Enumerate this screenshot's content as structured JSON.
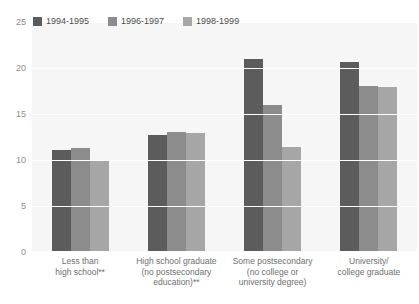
{
  "top_cut_text": "",
  "chart_data": {
    "type": "bar",
    "title": "",
    "xlabel": "",
    "ylabel": "",
    "ylim": [
      0,
      25
    ],
    "yticks": [
      0,
      5,
      10,
      15,
      20,
      25
    ],
    "grid": true,
    "legend_position": "top-left",
    "categories": [
      "Less than\nhigh school**",
      "High school graduate\n(no postsecondary\neducation)**",
      "Some postsecondary\n(no college or\nuniversity degree)",
      "University/\ncollege graduate"
    ],
    "series": [
      {
        "name": "1994-1995",
        "color": "#5c5c5c",
        "values": [
          11.1,
          12.7,
          21.0,
          20.6
        ]
      },
      {
        "name": "1996-1997",
        "color": "#8c8c8c",
        "values": [
          11.3,
          13.0,
          16.0,
          18.0
        ]
      },
      {
        "name": "1998-1999",
        "color": "#a6a6a6",
        "values": [
          10.0,
          12.9,
          11.4,
          17.9
        ]
      }
    ]
  },
  "colors": {
    "plot_background": "#f6f6f6",
    "gridline": "#ffffff",
    "axis_text": "#8d8d8d",
    "label_text": "#6f6f6f",
    "legend_text": "#4a4a4a"
  }
}
